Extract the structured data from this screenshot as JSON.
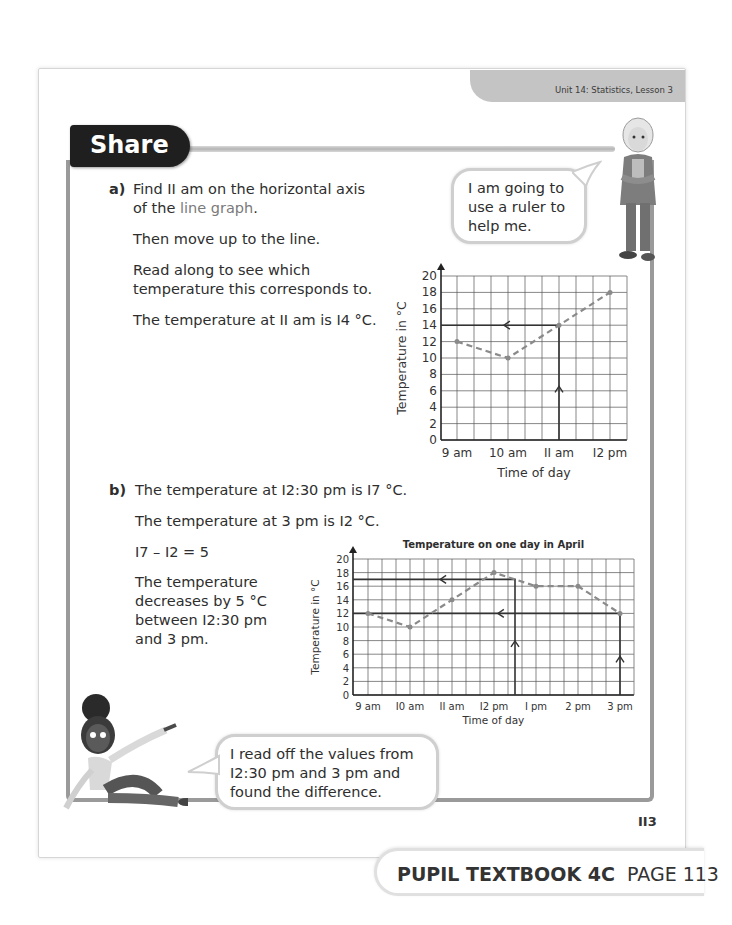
{
  "header": {
    "unit_label": "Unit 14: Statistics, Lesson 3"
  },
  "section": {
    "title": "Share"
  },
  "part_a": {
    "label": "a)",
    "line1": "Find II am on the horizontal axis",
    "line2_pre": "of the ",
    "line2_highlight": "line graph",
    "line2_post": ".",
    "line3": "Then move up to the line.",
    "line4": "Read along to see which",
    "line5": "temperature this corresponds to.",
    "line6": "The temperature at II am is I4 °C."
  },
  "bubble_boy": {
    "line1": "I am going to",
    "line2": "use a ruler to",
    "line3": "help me."
  },
  "part_b": {
    "label": "b)",
    "line1": "The temperature at I2:30 pm is I7 °C.",
    "line2": "The temperature at 3 pm is I2 °C.",
    "line3": "I7 – I2 = 5",
    "line4": "The temperature",
    "line5": "decreases by 5 °C",
    "line6": "between I2:30 pm",
    "line7": "and 3 pm."
  },
  "bubble_girl": {
    "line1": "I read off the values from",
    "line2": "I2:30 pm and 3 pm and",
    "line3": "found the difference."
  },
  "page_number": "II3",
  "footer": {
    "bold": "PUPIL TEXTBOOK 4C",
    "normal": "PAGE 113"
  },
  "chart_data": [
    {
      "type": "line",
      "title": "",
      "xlabel": "Time of day",
      "ylabel": "Temperature in °C",
      "categories": [
        "9 am",
        "10 am",
        "II am",
        "I2 pm"
      ],
      "x_hours": [
        9,
        10,
        11,
        12
      ],
      "values": [
        12,
        10,
        14,
        18
      ],
      "ylim": [
        0,
        20
      ],
      "yticks": [
        0,
        2,
        4,
        6,
        8,
        10,
        12,
        14,
        16,
        18,
        20
      ],
      "xlim_hours": [
        9,
        12.33
      ],
      "grid": true,
      "line_style": "dashed",
      "annotations": [
        {
          "type": "read-off",
          "x_hour": 11,
          "y": 14,
          "label": "II am → I4 °C"
        }
      ]
    },
    {
      "type": "line",
      "title": "Temperature on one day in April",
      "xlabel": "Time of day",
      "ylabel": "Temperature in °C",
      "categories": [
        "9 am",
        "I0 am",
        "II am",
        "I2 pm",
        "I pm",
        "2 pm",
        "3 pm"
      ],
      "x_hours": [
        9,
        10,
        11,
        12,
        13,
        14,
        15
      ],
      "values": [
        12,
        10,
        14,
        18,
        16,
        16,
        12
      ],
      "ylim": [
        0,
        20
      ],
      "yticks": [
        0,
        2,
        4,
        6,
        8,
        10,
        12,
        14,
        16,
        18,
        20
      ],
      "xlim_hours": [
        9,
        15.33
      ],
      "grid": true,
      "line_style": "dashed",
      "annotations": [
        {
          "type": "read-off",
          "x_hour": 12.5,
          "y": 17,
          "label": "I2:30 pm → I7 °C"
        },
        {
          "type": "read-off",
          "x_hour": 15,
          "y": 12,
          "label": "3 pm → I2 °C"
        }
      ]
    }
  ]
}
